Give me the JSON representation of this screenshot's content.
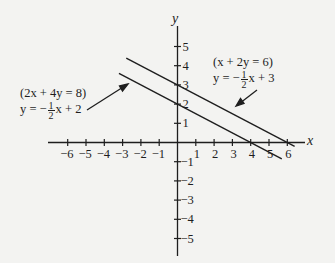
{
  "chart_data": {
    "type": "line",
    "title": "",
    "xlabel": "x",
    "ylabel": "y",
    "xlim": [
      -6.8,
      7
    ],
    "ylim": [
      -5.9,
      6
    ],
    "grid": false,
    "x_ticks": [
      -6,
      -5,
      -4,
      -3,
      -2,
      -1,
      1,
      2,
      3,
      4,
      5,
      6
    ],
    "y_ticks": [
      -5,
      -4,
      -3,
      -2,
      -1,
      1,
      2,
      3,
      4,
      5
    ],
    "x_tick_labels": [
      "-6",
      "-5",
      "-4",
      "-3",
      "-2",
      "-1",
      "1",
      "2",
      "3",
      "4",
      "5",
      "6"
    ],
    "y_tick_labels": [
      "-5",
      "-4",
      "-3",
      "-2",
      "-1",
      "1",
      "2",
      "3",
      "4",
      "5"
    ],
    "series": [
      {
        "name": "x + 2y = 6",
        "standard_form": "(x + 2y = 6)",
        "slope_intercept": "y = -1/2 x + 3",
        "slope": -0.5,
        "intercept": 3,
        "x": [
          -2.8,
          6.4
        ],
        "y": [
          4.4,
          -0.2
        ]
      },
      {
        "name": "2x + 4y = 8",
        "standard_form": "(2x + 4y = 8)",
        "slope_intercept": "y = -1/2 x + 2",
        "slope": -0.5,
        "intercept": 2,
        "x": [
          -3.2,
          5.7
        ],
        "y": [
          3.6,
          -0.85
        ]
      }
    ],
    "annotations": [
      {
        "text_line1": "(2x + 4y = 8)",
        "text_line2_prefix": "y = −",
        "frac_num": "1",
        "frac_den": "2",
        "text_line2_suffix": "x + 2",
        "points_to": "2x + 4y = 8"
      },
      {
        "text_line1": "(x + 2y = 6)",
        "text_line2_prefix": "y = −",
        "frac_num": "1",
        "frac_den": "2",
        "text_line2_suffix": "x + 3",
        "points_to": "x + 2y = 6"
      }
    ],
    "colors": {
      "background": "#f3f3f1",
      "ink": "#1e1e1e"
    }
  }
}
